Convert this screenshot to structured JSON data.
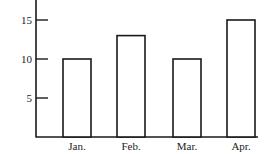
{
  "chart_data": {
    "type": "bar",
    "title": "",
    "xlabel": "",
    "ylabel": "",
    "categories": [
      "Jan.",
      "Feb.",
      "Mar.",
      "Apr."
    ],
    "values": [
      10,
      13,
      10,
      15
    ],
    "ylim": [
      0,
      17
    ],
    "yticks": [
      5,
      10,
      15
    ],
    "ytick_labels": [
      "5",
      "10",
      "15"
    ],
    "grid": false,
    "legend": null,
    "bar_fill": "#ffffff",
    "bar_stroke": "#1a1a1a"
  }
}
